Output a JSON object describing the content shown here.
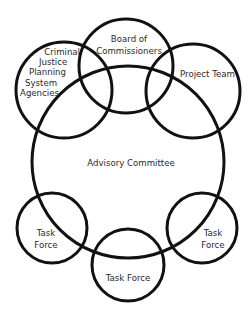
{
  "diagram": {
    "stroke_color": "#111111",
    "background": "#ffffff",
    "circles": {
      "criminal_justice": {
        "lines": [
          "Criminal",
          "Justice",
          "Planning",
          "System",
          "Agencies"
        ]
      },
      "board": {
        "lines": [
          "Board of",
          "Commissioners"
        ]
      },
      "project_team": {
        "label": "Project Team"
      },
      "advisory": {
        "label": "Advisory Committee"
      },
      "task_force_left": {
        "lines": [
          "Task",
          "Force"
        ]
      },
      "task_force_right": {
        "lines": [
          "Task",
          "Force"
        ]
      },
      "task_force_bottom": {
        "label": "Task Force"
      }
    }
  }
}
